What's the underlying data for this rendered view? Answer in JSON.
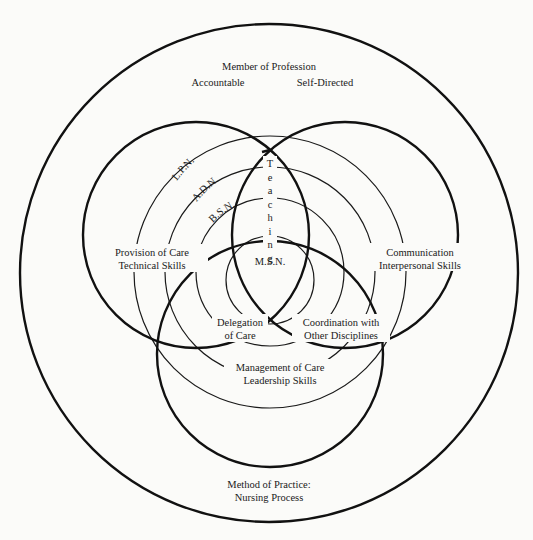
{
  "diagram": {
    "outer_circle": {
      "title": "Member of Profession",
      "attributes": [
        "Accountable",
        "Self-Directed"
      ],
      "method": {
        "line1": "Method of Practice:",
        "line2": "Nursing Process"
      }
    },
    "venn_circles": {
      "left": {
        "line1": "Provision of Care",
        "line2": "Technical Skills"
      },
      "right": {
        "line1": "Communication",
        "line2": "Interpersonal Skills"
      },
      "bottom": {
        "line1": "Management of Care",
        "line2": "Leadership Skills"
      }
    },
    "intersections": {
      "top": "Teaching",
      "left_bottom": {
        "line1": "Delegation",
        "line2": "of Care"
      },
      "right_bottom": {
        "line1": "Coordination with",
        "line2": "Other Disciplines"
      }
    },
    "concentric_levels": [
      {
        "label": "L.P.N."
      },
      {
        "label": "A.D.N."
      },
      {
        "label": "B.S.N."
      },
      {
        "label": "M.S.N."
      }
    ],
    "colors": {
      "line": "#111111",
      "background": "#fbfbf9",
      "text": "#1a1a1a"
    }
  }
}
